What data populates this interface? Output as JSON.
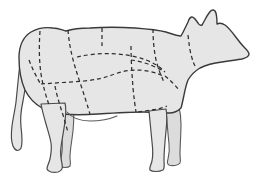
{
  "diagram": {
    "orientation": "facing-right",
    "caption": "",
    "colors": {
      "background": "#ffffff",
      "body_fill": "#e6e6e6",
      "body_outline": "#3a3a3a",
      "limb_fill": "#e6e6e6",
      "far_limb_fill": "#dcdcdc",
      "cut_line": "#2e2e2e"
    },
    "line_styles": {
      "outline": "solid",
      "cut_divider": "dashed",
      "dash_pattern": "4 3"
    },
    "parts": [
      {
        "name": "body-torso",
        "label": ""
      },
      {
        "name": "head",
        "label": ""
      },
      {
        "name": "ear-near",
        "label": ""
      },
      {
        "name": "ear-far",
        "label": ""
      },
      {
        "name": "neck",
        "label": ""
      },
      {
        "name": "tail",
        "label": ""
      },
      {
        "name": "foreleg-near",
        "label": ""
      },
      {
        "name": "foreleg-far",
        "label": ""
      },
      {
        "name": "hindleg-near",
        "label": ""
      },
      {
        "name": "hindleg-far",
        "label": ""
      },
      {
        "name": "udder",
        "label": ""
      }
    ],
    "cut_lines": [
      {
        "name": "round-rump-divider",
        "label": ""
      },
      {
        "name": "rump-loin-divider",
        "label": ""
      },
      {
        "name": "loin-rib-divider",
        "label": ""
      },
      {
        "name": "rib-chuck-divider",
        "label": ""
      },
      {
        "name": "chuck-neck-divider",
        "label": ""
      },
      {
        "name": "flank-horizontal",
        "label": ""
      },
      {
        "name": "plate-brisket-horizontal",
        "label": ""
      },
      {
        "name": "shank-fore-divider",
        "label": ""
      },
      {
        "name": "shank-hind-divider",
        "label": ""
      },
      {
        "name": "short-plate-divider",
        "label": ""
      },
      {
        "name": "flank-lower-divider",
        "label": ""
      },
      {
        "name": "brisket-divider",
        "label": ""
      }
    ]
  }
}
